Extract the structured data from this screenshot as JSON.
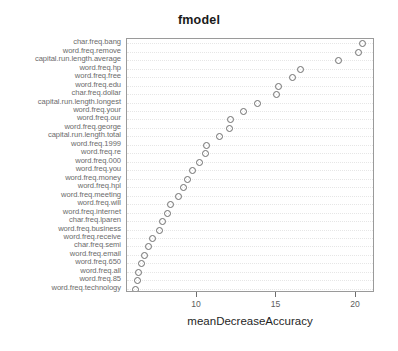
{
  "chart_data": {
    "type": "scatter",
    "title": "fmodel",
    "xlabel": "meanDecreaseAccuracy",
    "ylabel": "",
    "grid": true,
    "legend": null,
    "xlim": [
      5.6,
      21.2
    ],
    "xticks": [
      10,
      15,
      20
    ],
    "xticklabels": [
      "10",
      "15",
      "20"
    ],
    "orientation": "horizontal-dotchart",
    "categories": [
      "char.freq.bang",
      "word.freq.remove",
      "capital.run.length.average",
      "word.freq.hp",
      "word.freq.free",
      "word.freq.edu",
      "char.freq.dollar",
      "capital.run.length.longest",
      "word.freq.your",
      "word.freq.our",
      "word.freq.george",
      "capital.run.length.total",
      "word.freq.1999",
      "word.freq.re",
      "word.freq.000",
      "word.freq.you",
      "word.freq.money",
      "word.freq.hpl",
      "word.freq.meeting",
      "word.freq.will",
      "word.freq.internet",
      "char.freq.lparen",
      "word.freq.business",
      "word.freq.receive",
      "char.freq.semi",
      "word.freq.email",
      "word.freq.650",
      "word.freq.all",
      "word.freq.85",
      "word.freq.technology"
    ],
    "values": [
      20.4,
      20.1,
      18.9,
      16.5,
      16.0,
      15.1,
      15.0,
      13.8,
      12.9,
      12.1,
      12.0,
      11.4,
      10.6,
      10.5,
      10.1,
      9.7,
      9.4,
      9.1,
      8.8,
      8.3,
      8.1,
      7.8,
      7.6,
      7.2,
      6.9,
      6.7,
      6.5,
      6.3,
      6.2,
      6.1
    ]
  },
  "axis": {
    "x_title": "meanDecreaseAccuracy"
  }
}
